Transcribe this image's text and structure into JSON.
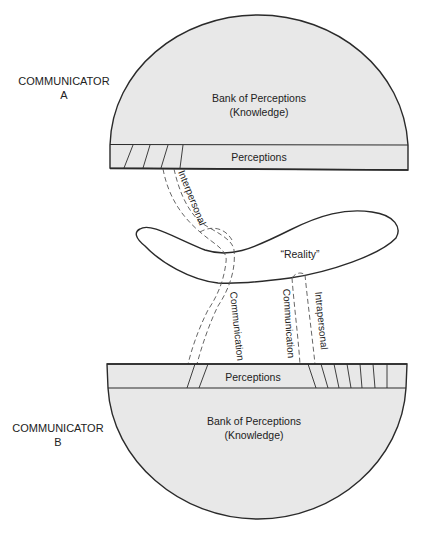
{
  "communicator_a": {
    "label_line1": "COMMUNICATOR",
    "label_line2": "A",
    "bank_line1": "Bank of Perceptions",
    "bank_line2": "(Knowledge)",
    "perceptions": "Perceptions"
  },
  "communicator_b": {
    "label_line1": "COMMUNICATOR",
    "label_line2": "B",
    "bank_line1": "Bank of Perceptions",
    "bank_line2": "(Knowledge)",
    "perceptions": "Perceptions"
  },
  "reality": {
    "label": "“Reality”"
  },
  "channels": {
    "interpersonal_a": "Interpersonal",
    "communication_a": "Communication",
    "communication_b": "Communication",
    "intrapersonal_b": "Intrapersonal"
  },
  "colors": {
    "fill": "#e8e8e8",
    "stroke": "#2a2a2a",
    "background": "#ffffff"
  }
}
